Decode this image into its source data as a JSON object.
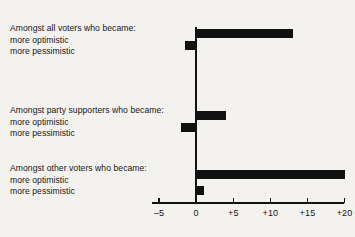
{
  "chart_data": {
    "type": "bar",
    "orientation": "horizontal",
    "title": "",
    "xlabel": "",
    "ylabel": "",
    "xlim": [
      -5,
      20
    ],
    "xticks": [
      -5,
      0,
      5,
      10,
      15,
      20
    ],
    "xtick_labels": [
      "–5",
      "0",
      "+5",
      "+10",
      "+15",
      "+20"
    ],
    "grid": false,
    "legend": "none",
    "zero_reference_line": true,
    "bar_color": "#111111",
    "groups": [
      {
        "heading": "Amongst all voters who became:",
        "bars": [
          {
            "label": "more optimistic",
            "value": 13
          },
          {
            "label": "more pessimistic",
            "value": -1.5
          }
        ]
      },
      {
        "heading": "Amongst party supporters who became:",
        "bars": [
          {
            "label": "more optimistic",
            "value": 4
          },
          {
            "label": "more pessimistic",
            "value": -2
          }
        ]
      },
      {
        "heading": "Amongst other voters who became:",
        "bars": [
          {
            "label": "more optimistic",
            "value": 20
          },
          {
            "label": "more pessimistic",
            "value": 1
          }
        ]
      }
    ]
  }
}
